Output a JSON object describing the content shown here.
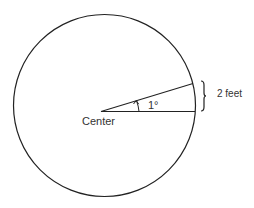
{
  "diagram": {
    "center_label": "Center",
    "angle_label": "1°",
    "arc_length_label": "2 feet",
    "stroke_color": "#222222",
    "text_color": "#333333"
  }
}
